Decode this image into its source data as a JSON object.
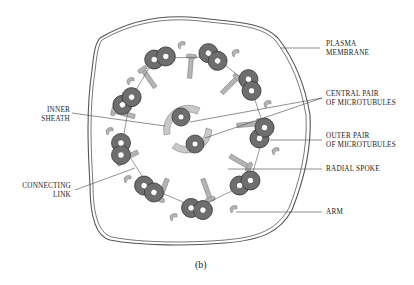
{
  "figure": {
    "caption": "(b)",
    "colors": {
      "doublet_fill": "#6e6e6e",
      "doublet_stroke": "#3a3a3a",
      "spoke_fill": "#b4b4b4",
      "membrane_stroke": "#555555",
      "background": "#ffffff"
    }
  },
  "labels": {
    "plasma_membrane": [
      "PLASMA",
      "MEMBRANE"
    ],
    "central_pair": [
      "CENTRAL PAIR",
      "OF MICROTUBULES"
    ],
    "outer_pair": [
      "OUTER PAIR",
      "OF MICROTUBULES"
    ],
    "radial_spoke": [
      "RADIAL SPOKE"
    ],
    "arm": [
      "ARM"
    ],
    "inner_sheath": [
      "INNER",
      "SHEATH"
    ],
    "connecting_link": [
      "CONNECTING",
      "LINK"
    ]
  }
}
